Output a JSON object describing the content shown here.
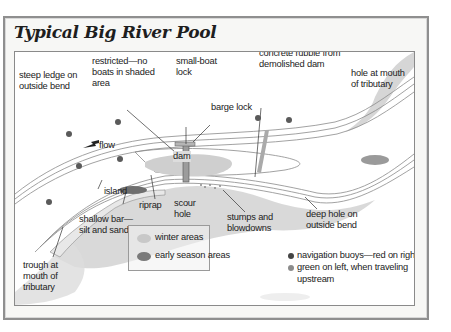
{
  "title": "Typical Big River Pool",
  "colors": {
    "water_lines": "#8a8a8a",
    "shaded_winter": "#c9c9c9",
    "shaded_early": "#7f7f7f",
    "buoy_red": "#5a5a5a",
    "buoy_green": "#8c8c8c",
    "frame_border": "#8f8f8f"
  },
  "labels": {
    "restricted": [
      "restricted—no",
      "boats in shaded",
      "area"
    ],
    "small_boat_lock": [
      "small-boat",
      "lock"
    ],
    "barge_lock": "barge lock",
    "concrete_rubble": [
      "concrete rubble from",
      "demolished dam"
    ],
    "steep_ledge": [
      "steep ledge on",
      "outside bend"
    ],
    "hole_mouth": [
      "hole at mouth",
      "of tributary"
    ],
    "flow": "flow",
    "dam": "dam",
    "island": "island",
    "riprap": "riprap",
    "scour_hole": [
      "scour",
      "hole"
    ],
    "stumps": [
      "stumps and",
      "blowdowns"
    ],
    "deep_hole": [
      "deep hole on",
      "outside bend"
    ],
    "shallow_bar": [
      "shallow bar—",
      "silt and sand"
    ],
    "trough": [
      "trough at",
      "mouth of",
      "tributary"
    ]
  },
  "legend": {
    "winter": "winter areas",
    "early": "early season areas"
  },
  "buoy_note": {
    "line1": "navigation buoys—red on right,",
    "line2": "green on left, when traveling",
    "line3": "upstream"
  }
}
